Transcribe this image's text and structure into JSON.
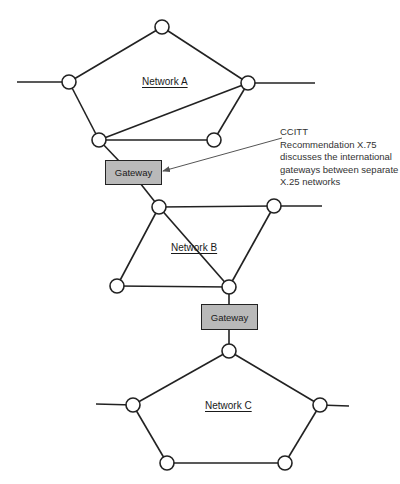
{
  "networks": [
    {
      "label": "Network A"
    },
    {
      "label": "Network B"
    },
    {
      "label": "Network C"
    }
  ],
  "gateways": [
    {
      "label": "Gateway"
    },
    {
      "label": "Gateway"
    }
  ],
  "annotation": {
    "lines": [
      "CCITT",
      "Recommendation X.75",
      "discusses the international",
      " gateways between separate",
      " X.25 networks"
    ]
  },
  "colors": {
    "gateway_fill": "#b9b9b9",
    "line": "#222222"
  }
}
